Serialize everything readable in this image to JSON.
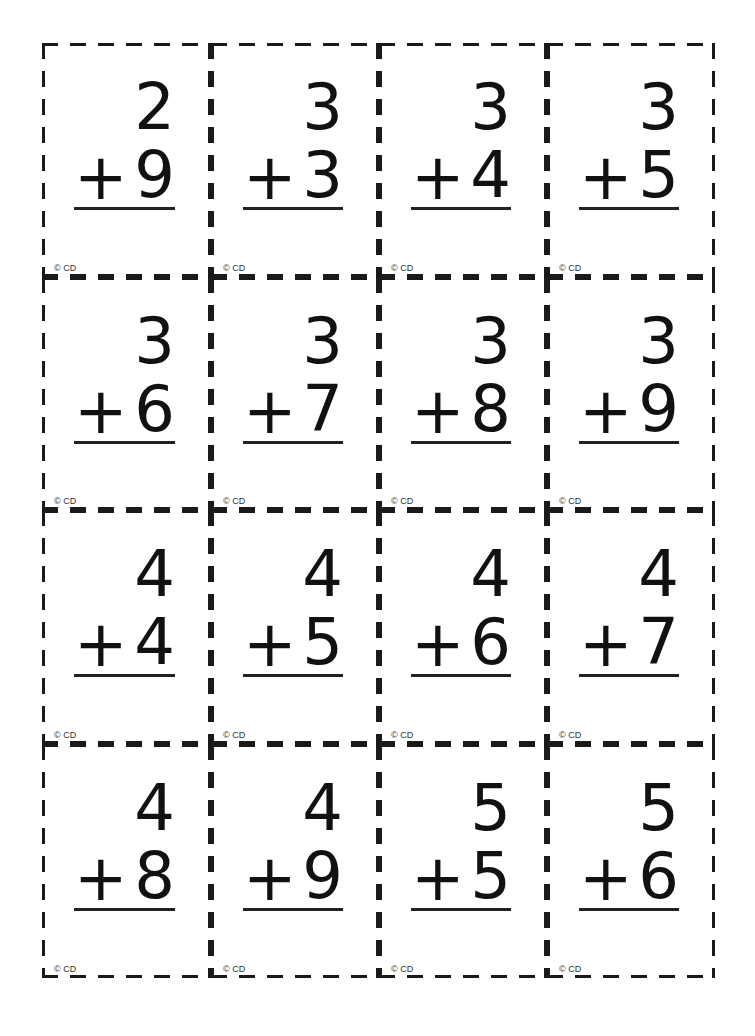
{
  "cards": [
    {
      "top": "2",
      "op": "+",
      "bottom": "9",
      "copyright": "© CD"
    },
    {
      "top": "3",
      "op": "+",
      "bottom": "3",
      "copyright": "© CD"
    },
    {
      "top": "3",
      "op": "+",
      "bottom": "4",
      "copyright": "© CD"
    },
    {
      "top": "3",
      "op": "+",
      "bottom": "5",
      "copyright": "© CD"
    },
    {
      "top": "3",
      "op": "+",
      "bottom": "6",
      "copyright": "© CD"
    },
    {
      "top": "3",
      "op": "+",
      "bottom": "7",
      "copyright": "© CD"
    },
    {
      "top": "3",
      "op": "+",
      "bottom": "8",
      "copyright": "© CD"
    },
    {
      "top": "3",
      "op": "+",
      "bottom": "9",
      "copyright": "© CD"
    },
    {
      "top": "4",
      "op": "+",
      "bottom": "4",
      "copyright": "© CD"
    },
    {
      "top": "4",
      "op": "+",
      "bottom": "5",
      "copyright": "© CD"
    },
    {
      "top": "4",
      "op": "+",
      "bottom": "6",
      "copyright": "© CD"
    },
    {
      "top": "4",
      "op": "+",
      "bottom": "7",
      "copyright": "© CD"
    },
    {
      "top": "4",
      "op": "+",
      "bottom": "8",
      "copyright": "© CD"
    },
    {
      "top": "4",
      "op": "+",
      "bottom": "9",
      "copyright": "© CD"
    },
    {
      "top": "5",
      "op": "+",
      "bottom": "5",
      "copyright": "© CD"
    },
    {
      "top": "5",
      "op": "+",
      "bottom": "6",
      "copyright": "© CD"
    }
  ]
}
